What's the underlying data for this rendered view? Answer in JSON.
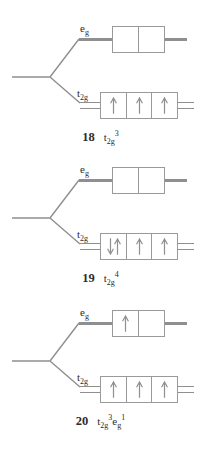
{
  "figure": {
    "background": "#ffffff",
    "description_colors": {
      "line": "#8f8f8f",
      "box_border": "#9a9a9a",
      "arrow": "#8f8f8f",
      "text": "#2b2b2b"
    }
  },
  "diagrams": [
    {
      "eg_label": {
        "base": "e",
        "sub": "g"
      },
      "t2g_label": {
        "base": "t",
        "sub": "2g"
      },
      "eg_boxes": [
        "empty",
        "empty"
      ],
      "t2g_boxes": [
        "up",
        "up",
        "up"
      ],
      "caption": {
        "number": "18",
        "formula": [
          {
            "base": "t",
            "sub": "2g",
            "sup": "3"
          }
        ]
      }
    },
    {
      "eg_label": {
        "base": "e",
        "sub": "g"
      },
      "t2g_label": {
        "base": "t",
        "sub": "2g"
      },
      "eg_boxes": [
        "empty",
        "empty"
      ],
      "t2g_boxes": [
        "pair",
        "up",
        "up"
      ],
      "caption": {
        "number": "19",
        "formula": [
          {
            "base": "t",
            "sub": "2g",
            "sup": "4"
          }
        ]
      }
    },
    {
      "eg_label": {
        "base": "e",
        "sub": "g"
      },
      "t2g_label": {
        "base": "t",
        "sub": "2g"
      },
      "eg_boxes": [
        "up",
        "empty"
      ],
      "t2g_boxes": [
        "up",
        "up",
        "up"
      ],
      "caption": {
        "number": "20",
        "formula": [
          {
            "base": "t",
            "sub": "2g",
            "sup": "3"
          },
          {
            "base": "e",
            "sub": "g",
            "sup": "1"
          }
        ]
      }
    }
  ]
}
